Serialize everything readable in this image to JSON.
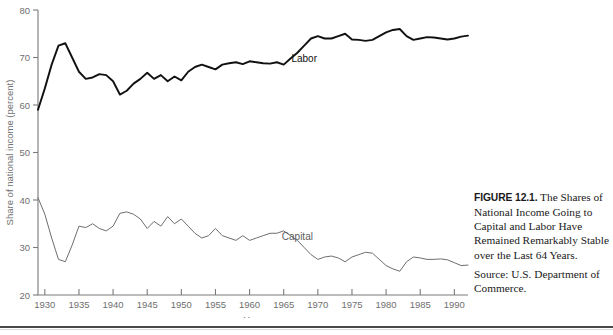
{
  "figure": {
    "caption_number": "FIGURE 12.1.",
    "caption_text": " The Shares of National Income Going to Capital and Labor Have Remained Remarkably Stable over the Last 64 Years.",
    "source": "Source: U.S. Department of Commerce."
  },
  "chart_data": {
    "type": "line",
    "title": "",
    "xlabel": "Year",
    "ylabel": "Share of national income (percent)",
    "xlim": [
      1929,
      1992
    ],
    "ylim": [
      20,
      80
    ],
    "xticks": [
      1930,
      1935,
      1940,
      1945,
      1950,
      1955,
      1960,
      1965,
      1970,
      1975,
      1980,
      1985,
      1990
    ],
    "yticks": [
      20,
      30,
      40,
      50,
      60,
      70,
      80
    ],
    "grid": false,
    "legend": "inline-labels",
    "x": [
      1929,
      1930,
      1931,
      1932,
      1933,
      1934,
      1935,
      1936,
      1937,
      1938,
      1939,
      1940,
      1941,
      1942,
      1943,
      1944,
      1945,
      1946,
      1947,
      1948,
      1949,
      1950,
      1951,
      1952,
      1953,
      1954,
      1955,
      1956,
      1957,
      1958,
      1959,
      1960,
      1961,
      1962,
      1963,
      1964,
      1965,
      1966,
      1967,
      1968,
      1969,
      1970,
      1971,
      1972,
      1973,
      1974,
      1975,
      1976,
      1977,
      1978,
      1979,
      1980,
      1981,
      1982,
      1983,
      1984,
      1985,
      1986,
      1987,
      1988,
      1989,
      1990,
      1991,
      1992
    ],
    "series": [
      {
        "name": "Labor",
        "color": "#111111",
        "label_x": 1968,
        "label_y": 69.0,
        "values": [
          59.0,
          63.5,
          68.5,
          72.5,
          73.0,
          70.0,
          67.0,
          65.5,
          65.8,
          66.5,
          66.3,
          65.0,
          62.2,
          63.0,
          64.5,
          65.5,
          66.8,
          65.5,
          66.3,
          65.0,
          66.0,
          65.2,
          67.0,
          68.0,
          68.5,
          68.0,
          67.5,
          68.5,
          68.8,
          69.0,
          68.6,
          69.2,
          69.0,
          68.8,
          68.7,
          69.0,
          68.5,
          69.8,
          71.0,
          72.5,
          74.0,
          74.5,
          74.0,
          74.0,
          74.5,
          75.0,
          73.8,
          73.7,
          73.5,
          73.7,
          74.5,
          75.3,
          75.8,
          76.0,
          74.5,
          73.7,
          74.0,
          74.3,
          74.2,
          74.0,
          73.8,
          74.0,
          74.4,
          74.6
        ]
      },
      {
        "name": "Capital",
        "color": "#6e6e6e",
        "label_x": 1967,
        "label_y": 31.5,
        "values": [
          40.5,
          37.0,
          32.0,
          27.5,
          27.0,
          30.5,
          34.5,
          34.2,
          35.0,
          34.0,
          33.5,
          34.5,
          37.2,
          37.5,
          37.0,
          36.0,
          34.0,
          35.5,
          34.5,
          36.5,
          35.0,
          36.0,
          34.5,
          33.0,
          32.0,
          32.5,
          34.0,
          32.5,
          32.0,
          31.5,
          32.5,
          31.5,
          32.0,
          32.5,
          33.0,
          33.0,
          33.5,
          32.5,
          31.5,
          30.0,
          28.5,
          27.5,
          28.0,
          28.2,
          27.8,
          27.0,
          28.0,
          28.5,
          29.0,
          28.8,
          27.5,
          26.2,
          25.5,
          25.0,
          27.0,
          28.0,
          27.8,
          27.5,
          27.5,
          27.6,
          27.4,
          26.8,
          26.2,
          26.3
        ]
      }
    ]
  }
}
